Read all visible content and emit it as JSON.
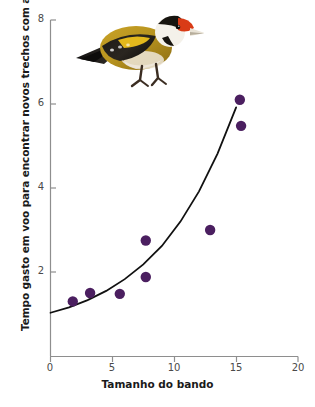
{
  "chart_data": {
    "type": "scatter",
    "title": "",
    "xlabel": "Tamanho do bando",
    "ylabel": "Tempo gasto em voo para encontrar novos trechos com alimento (s)",
    "xlim": [
      0,
      20
    ],
    "ylim": [
      0,
      8
    ],
    "xticks": [
      "0",
      "5",
      "10",
      "15",
      "20"
    ],
    "yticks": [
      "2",
      "4",
      "6",
      "8"
    ],
    "grid": false,
    "legend": null,
    "point_color": "#4b1f60",
    "curve_color": "#111111",
    "points": [
      {
        "x": 1.8,
        "y": 1.3
      },
      {
        "x": 3.2,
        "y": 1.5
      },
      {
        "x": 5.6,
        "y": 1.48
      },
      {
        "x": 7.7,
        "y": 1.88
      },
      {
        "x": 7.7,
        "y": 2.75
      },
      {
        "x": 12.9,
        "y": 3.0
      },
      {
        "x": 15.3,
        "y": 6.1
      },
      {
        "x": 15.4,
        "y": 5.48
      }
    ],
    "series": [
      {
        "name": "fitted exponential curve",
        "type": "line",
        "x": [
          0.0,
          1.5,
          3.0,
          4.5,
          6.0,
          7.5,
          9.0,
          10.5,
          12.0,
          13.5,
          15.0
        ],
        "y": [
          1.03,
          1.16,
          1.33,
          1.55,
          1.83,
          2.18,
          2.62,
          3.2,
          3.92,
          4.82,
          5.92
        ]
      }
    ],
    "annotations": [
      {
        "name": "goldfinch-photo",
        "description": "European goldfinch bird photograph"
      }
    ]
  },
  "axes": {
    "x_axis_name": "x-axis",
    "y_axis_name": "y-axis"
  }
}
